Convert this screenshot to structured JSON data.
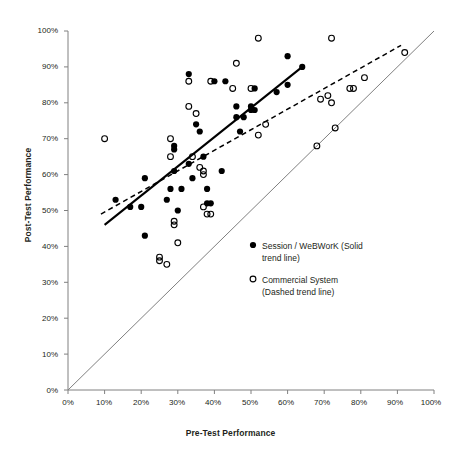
{
  "chart_data": {
    "type": "scatter",
    "title": "",
    "xlabel": "Pre-Test Performance",
    "ylabel": "Post-Test Performance",
    "xlim": [
      0,
      100
    ],
    "ylim": [
      0,
      100
    ],
    "grid": false,
    "legend_position": "inside-lower-right",
    "axis_tick_suffix": "%",
    "xticks": [
      0,
      10,
      20,
      30,
      40,
      50,
      60,
      70,
      80,
      90,
      100
    ],
    "yticks": [
      0,
      10,
      20,
      30,
      40,
      50,
      60,
      70,
      80,
      90,
      100
    ],
    "xtick_labels": [
      "0%",
      "10%",
      "20%",
      "30%",
      "40%",
      "50%",
      "60%",
      "70%",
      "80%",
      "90%",
      "100%"
    ],
    "ytick_labels": [
      "0%",
      "10%",
      "20%",
      "30%",
      "40%",
      "50%",
      "60%",
      "70%",
      "80%",
      "90%",
      "100%"
    ],
    "series": [
      {
        "name": "Session / WeBWorK (Solid trend line)",
        "marker": "filled-circle",
        "color": "#000000",
        "points": [
          [
            13,
            53
          ],
          [
            17,
            51
          ],
          [
            20,
            51
          ],
          [
            21,
            59
          ],
          [
            21,
            43
          ],
          [
            27,
            53
          ],
          [
            28,
            56
          ],
          [
            29,
            61
          ],
          [
            29,
            67
          ],
          [
            29,
            68
          ],
          [
            30,
            50
          ],
          [
            31,
            56
          ],
          [
            33,
            88
          ],
          [
            33,
            63
          ],
          [
            34,
            59
          ],
          [
            35,
            74
          ],
          [
            36,
            72
          ],
          [
            37,
            65
          ],
          [
            38,
            56
          ],
          [
            38,
            52
          ],
          [
            39,
            52
          ],
          [
            40,
            86
          ],
          [
            42,
            61
          ],
          [
            43,
            86
          ],
          [
            46,
            79
          ],
          [
            46,
            76
          ],
          [
            47,
            72
          ],
          [
            48,
            76
          ],
          [
            50,
            78
          ],
          [
            50,
            79
          ],
          [
            51,
            84
          ],
          [
            51,
            78
          ],
          [
            57,
            83
          ],
          [
            60,
            93
          ],
          [
            60,
            85
          ],
          [
            64,
            90
          ]
        ]
      },
      {
        "name": "Commercial System (Dashed trend line)",
        "marker": "open-circle",
        "color": "#000000",
        "points": [
          [
            10,
            70
          ],
          [
            25,
            37
          ],
          [
            25,
            36
          ],
          [
            27,
            35
          ],
          [
            28,
            65
          ],
          [
            28,
            70
          ],
          [
            29,
            46
          ],
          [
            29,
            47
          ],
          [
            30,
            41
          ],
          [
            33,
            86
          ],
          [
            33,
            79
          ],
          [
            34,
            65
          ],
          [
            35,
            77
          ],
          [
            36,
            62
          ],
          [
            37,
            60
          ],
          [
            37,
            61
          ],
          [
            37,
            51
          ],
          [
            38,
            49
          ],
          [
            39,
            86
          ],
          [
            39,
            49
          ],
          [
            45,
            84
          ],
          [
            46,
            91
          ],
          [
            50,
            84
          ],
          [
            52,
            98
          ],
          [
            52,
            71
          ],
          [
            54,
            74
          ],
          [
            68,
            68
          ],
          [
            69,
            81
          ],
          [
            71,
            82
          ],
          [
            72,
            98
          ],
          [
            72,
            80
          ],
          [
            73,
            73
          ],
          [
            77,
            84
          ],
          [
            78,
            84
          ],
          [
            81,
            87
          ],
          [
            92,
            94
          ]
        ]
      }
    ],
    "trend_lines": [
      {
        "name": "solid-trend-line",
        "style": "solid",
        "series": "Session / WeBWorK",
        "x_start": 10,
        "y_start": 46,
        "x_end": 64,
        "y_end": 90
      },
      {
        "name": "dashed-trend-line",
        "style": "dashed",
        "series": "Commercial System",
        "x_start": 9,
        "y_start": 49,
        "x_end": 91,
        "y_end": 96
      }
    ],
    "reference_line": {
      "name": "identity-line",
      "style": "solid-gray",
      "color": "#808080",
      "x_start": 0,
      "y_start": 0,
      "x_end": 100,
      "y_end": 100
    }
  },
  "legend": {
    "entries": [
      {
        "marker": "filled-circle",
        "label_line1": "Session / WeBWorK (Solid",
        "label_line2": "trend line)"
      },
      {
        "marker": "open-circle",
        "label_line1": "Commercial System",
        "label_line2": "(Dashed trend line)"
      }
    ]
  },
  "colors": {
    "text": "#231f20",
    "axis": "#808080",
    "marker": "#000000",
    "reference": "#999999"
  }
}
